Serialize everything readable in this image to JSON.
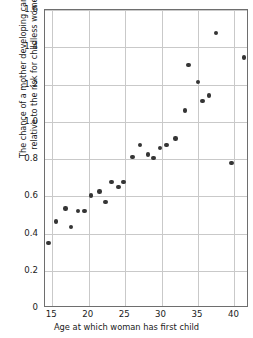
{
  "chart_data": {
    "type": "scatter",
    "title": "",
    "xlabel": "Age at which woman has first child",
    "ylabel": "The chance of a mother developing cancer\nrelative to the risk for childless women",
    "xlim": [
      14.0,
      42.0
    ],
    "ylim": [
      0,
      1.6
    ],
    "grid": true,
    "legend": null,
    "xticks": [
      "15",
      "20",
      "25",
      "30",
      "35",
      "40"
    ],
    "xtick_values": [
      15,
      20,
      25,
      30,
      35,
      40
    ],
    "yticks": [
      "0",
      "0.2",
      "0.4",
      "0.6",
      "0.8",
      "1.0",
      "1.2",
      "1.4",
      "1.6"
    ],
    "ytick_values": [
      0,
      0.2,
      0.4,
      0.6,
      0.8,
      1.0,
      1.2,
      1.4,
      1.6
    ],
    "marker": "filled-circle",
    "marker_color": "#353535",
    "grid_color": "#c9c9c9",
    "axis_color": "#6e6e6e",
    "points": [
      {
        "x": 14.5,
        "y": 0.35
      },
      {
        "x": 15.5,
        "y": 0.465
      },
      {
        "x": 16.8,
        "y": 0.535
      },
      {
        "x": 17.6,
        "y": 0.435
      },
      {
        "x": 18.5,
        "y": 0.52
      },
      {
        "x": 19.4,
        "y": 0.52
      },
      {
        "x": 20.3,
        "y": 0.605
      },
      {
        "x": 21.5,
        "y": 0.625
      },
      {
        "x": 22.3,
        "y": 0.57
      },
      {
        "x": 23.1,
        "y": 0.675
      },
      {
        "x": 24.1,
        "y": 0.65
      },
      {
        "x": 24.8,
        "y": 0.675
      },
      {
        "x": 26.0,
        "y": 0.81
      },
      {
        "x": 27.0,
        "y": 0.875
      },
      {
        "x": 28.1,
        "y": 0.825
      },
      {
        "x": 28.9,
        "y": 0.805
      },
      {
        "x": 29.8,
        "y": 0.86
      },
      {
        "x": 30.7,
        "y": 0.875
      },
      {
        "x": 31.9,
        "y": 0.91
      },
      {
        "x": 33.2,
        "y": 1.06
      },
      {
        "x": 33.7,
        "y": 1.305
      },
      {
        "x": 35.0,
        "y": 1.215
      },
      {
        "x": 35.6,
        "y": 1.11
      },
      {
        "x": 36.5,
        "y": 1.14
      },
      {
        "x": 37.5,
        "y": 1.475
      },
      {
        "x": 39.6,
        "y": 0.78
      },
      {
        "x": 41.3,
        "y": 1.345
      }
    ]
  },
  "axes": {
    "x_title": "Age at which woman has first child",
    "y_title_line1": "The chance of a mother developing cancer",
    "y_title_line2": "relative to the risk for childless women"
  }
}
